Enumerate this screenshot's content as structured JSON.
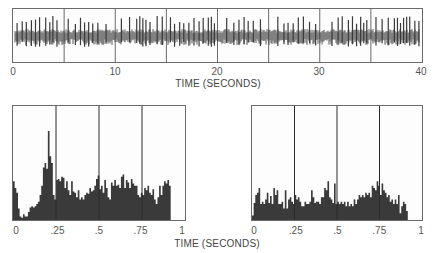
{
  "figure": {
    "top_xlabel": "TIME (SECONDS)",
    "bottom_xlabel": "TIME (SECONDS)",
    "colors": {
      "ink": "#3a3a3a",
      "frame": "#6a6a6a",
      "background": "#ffffff"
    }
  },
  "chart_data": [
    {
      "type": "line",
      "title": "",
      "description": "Continuous spike train recording (raster trace) over 40 seconds",
      "xlabel": "TIME (SECONDS)",
      "ylabel": "",
      "xlim": [
        0,
        40
      ],
      "xticks": [
        "0",
        "10",
        "20",
        "30",
        "40"
      ],
      "grid_vertical_at": [
        5,
        10,
        15,
        20,
        25,
        30,
        35
      ],
      "spike_times_approx": [
        0.4,
        0.9,
        1.3,
        1.8,
        2.2,
        2.6,
        3.2,
        3.6,
        3.9,
        4.3,
        5.4,
        6.1,
        6.6,
        7.0,
        7.4,
        7.8,
        8.3,
        9.1,
        10.6,
        11.4,
        12.1,
        12.4,
        12.7,
        13.0,
        13.4,
        14.1,
        14.6,
        15.4,
        15.8,
        16.3,
        16.7,
        17.2,
        17.7,
        18.2,
        18.6,
        19.1,
        19.4,
        19.7,
        20.9,
        21.6,
        22.1,
        22.6,
        23.0,
        23.5,
        24.2,
        25.9,
        26.5,
        26.9,
        27.4,
        27.9,
        28.4,
        29.0,
        29.6,
        31.2,
        31.8,
        32.2,
        32.8,
        33.2,
        33.6,
        34.0,
        34.3,
        34.6,
        35.5,
        36.1,
        36.7,
        37.3,
        37.6,
        37.9,
        38.2,
        38.5,
        38.8,
        39.3,
        39.7
      ]
    },
    {
      "type": "bar",
      "title": "",
      "description": "Peri-stimulus time histogram (left)",
      "xlabel": "TIME (SECONDS)",
      "ylabel": "",
      "xlim": [
        0,
        1
      ],
      "xticks": [
        "0",
        ".25",
        ".5",
        ".75",
        "1"
      ],
      "grid_vertical_at": [
        0.25,
        0.5,
        0.75
      ],
      "ylim": [
        0,
        100
      ],
      "bin_width": 0.01,
      "values": [
        34,
        28,
        24,
        10,
        3,
        2,
        5,
        3,
        3,
        7,
        11,
        12,
        11,
        12,
        14,
        16,
        22,
        30,
        46,
        50,
        45,
        78,
        56,
        50,
        22,
        18,
        35,
        36,
        34,
        38,
        37,
        28,
        34,
        26,
        22,
        34,
        25,
        24,
        20,
        26,
        18,
        20,
        18,
        22,
        24,
        23,
        28,
        25,
        26,
        30,
        36,
        39,
        27,
        30,
        24,
        35,
        28,
        20,
        18,
        33,
        30,
        35,
        30,
        31,
        28,
        38,
        40,
        28,
        35,
        33,
        28,
        36,
        32,
        30,
        30,
        22,
        20,
        24,
        22,
        28,
        26,
        30,
        24,
        22,
        27,
        18,
        14,
        20,
        30,
        22,
        30,
        34,
        32,
        35,
        30
      ]
    },
    {
      "type": "bar",
      "title": "",
      "description": "Peri-stimulus time histogram (right)",
      "xlabel": "TIME (SECONDS)",
      "ylabel": "",
      "xlim": [
        0,
        1
      ],
      "xticks": [
        "0",
        ".25",
        ".5",
        ".75",
        "1"
      ],
      "grid_vertical_at": [
        0.25,
        0.5,
        0.75
      ],
      "ylim": [
        0,
        100
      ],
      "bin_width": 0.01,
      "values": [
        4,
        15,
        22,
        24,
        28,
        14,
        16,
        14,
        18,
        24,
        15,
        21,
        14,
        28,
        22,
        26,
        14,
        14,
        16,
        10,
        26,
        10,
        18,
        20,
        16,
        14,
        22,
        18,
        20,
        16,
        12,
        12,
        16,
        14,
        14,
        16,
        26,
        20,
        15,
        16,
        16,
        14,
        20,
        20,
        28,
        26,
        34,
        20,
        18,
        15,
        32,
        14,
        16,
        14,
        16,
        14,
        16,
        12,
        16,
        12,
        14,
        12,
        18,
        14,
        18,
        22,
        20,
        22,
        20,
        24,
        22,
        24,
        20,
        30,
        28,
        26,
        34,
        30,
        22,
        32,
        26,
        24,
        20,
        22,
        16,
        18,
        14,
        18,
        14,
        22,
        6,
        12,
        16,
        14,
        8
      ]
    }
  ]
}
